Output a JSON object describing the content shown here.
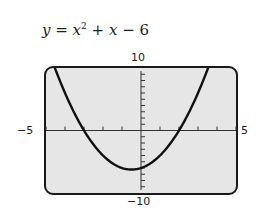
{
  "equation": {
    "lhs": "y",
    "eq": " = ",
    "var": "x",
    "exp": "2",
    "rest_op1": " + ",
    "var2": "x",
    "rest_op2": " − ",
    "const": "6"
  },
  "labels": {
    "ymax": "10",
    "ymin": "−10",
    "xmin": "−5",
    "xmax": "5"
  },
  "colors": {
    "screen_bg": "#e6e6e6",
    "frame": "#1a1a1a",
    "curve": "#111111",
    "axis": "#333333"
  },
  "chart_data": {
    "type": "line",
    "function": "x^2 + x - 6",
    "xlabel": "",
    "ylabel": "",
    "xlim": [
      -5,
      5
    ],
    "ylim": [
      -10,
      10
    ],
    "xscale": 1,
    "yscale": 1,
    "grid": false,
    "legend": "none",
    "x": [
      -4.5,
      -4,
      -3,
      -2,
      -1,
      -0.5,
      0,
      1,
      2,
      3,
      3.5
    ],
    "y": [
      9.75,
      6,
      0,
      -4,
      -6,
      -6.25,
      -6,
      -4,
      0,
      6,
      9.75
    ],
    "annotations": [
      "x-intercepts at -3 and 2",
      "vertex at (-0.5, -6.25)"
    ]
  }
}
